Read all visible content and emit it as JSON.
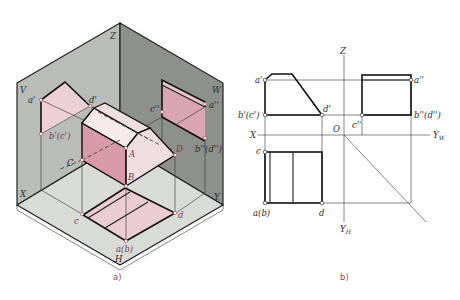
{
  "figure": {
    "panel_a": {
      "caption": "a)",
      "plane_labels": {
        "z": "Z",
        "v": "V",
        "w": "W",
        "x": "X",
        "y": "Y",
        "h": "H"
      },
      "point_labels": {
        "a_prime": "a'",
        "d_prime": "d'",
        "b_prime_c_prime": "b'(c')",
        "c_dblprime": "c''",
        "a_dblprime": "a''",
        "b_dblprime_d_dblprime": "b''(d'')",
        "A": "A",
        "B": "B",
        "C": "C",
        "D": "D",
        "c": "c",
        "d": "d",
        "a_b": "a(b)"
      },
      "colors": {
        "v_plane": "#b9bcb8",
        "w_plane": "#8e908d",
        "h_plane": "#d9dbd7",
        "projection_fill": "#e8c4cc",
        "solid_light": "#f3e4e7",
        "solid_dark": "#d89aa8"
      }
    },
    "panel_b": {
      "caption": "b)",
      "axis_labels": {
        "z": "Z",
        "x": "X",
        "o": "O",
        "yw": "Y",
        "yw_sub": "W",
        "yh": "Y",
        "yh_sub": "H"
      },
      "point_labels": {
        "a_prime": "a'",
        "b_prime_c_prime": "b'(c')",
        "d_prime": "d'",
        "c_dblprime": "c''",
        "a_dblprime": "a''",
        "b_dblprime_d_dblprime": "b''(d'')",
        "c": "c",
        "a_b": "a(b)",
        "d": "d"
      }
    }
  }
}
